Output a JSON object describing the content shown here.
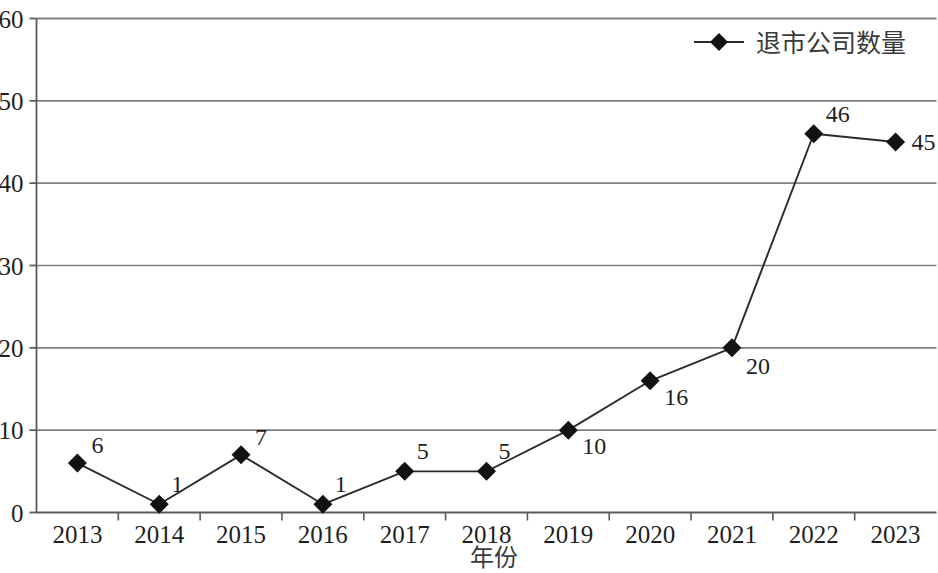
{
  "chart_data": {
    "type": "line",
    "title": "",
    "subtitle": "",
    "xlabel": "年份",
    "ylabel": "",
    "categories": [
      "2013",
      "2014",
      "2015",
      "2016",
      "2017",
      "2018",
      "2019",
      "2020",
      "2021",
      "2022",
      "2023"
    ],
    "values": [
      6,
      1,
      7,
      1,
      5,
      5,
      10,
      16,
      20,
      46,
      45
    ],
    "data_labels": [
      "6",
      "1",
      "7",
      "1",
      "5",
      "5",
      "10",
      "16",
      "20",
      "46",
      "45"
    ],
    "series": [
      {
        "name": "退市公司数量",
        "values": [
          6,
          1,
          7,
          1,
          5,
          5,
          10,
          16,
          20,
          46,
          45
        ],
        "marker": "diamond",
        "color": "#1a1a1a"
      }
    ],
    "ylim": [
      0,
      60
    ],
    "yticks": [
      0,
      10,
      20,
      30,
      40,
      50,
      60
    ],
    "ytick_labels": [
      "0",
      "10",
      "20",
      "30",
      "40",
      "50",
      "60"
    ],
    "grid": "horizontal",
    "legend_position": "top-right",
    "legend": [
      "退市公司数量"
    ],
    "line_color": "#2b2b2b",
    "grid_color": "#808080",
    "axis_color": "#5a5a5a",
    "label_offsets": [
      {
        "dx": 14,
        "dy": -10
      },
      {
        "dx": 12,
        "dy": -12
      },
      {
        "dx": 14,
        "dy": -10
      },
      {
        "dx": 12,
        "dy": -12
      },
      {
        "dx": 12,
        "dy": -12
      },
      {
        "dx": 12,
        "dy": -12
      },
      {
        "dx": 14,
        "dy": 24
      },
      {
        "dx": 14,
        "dy": 24
      },
      {
        "dx": 14,
        "dy": 26
      },
      {
        "dx": 12,
        "dy": -12
      },
      {
        "dx": 16,
        "dy": 8
      }
    ]
  },
  "legend": {
    "label": "退市公司数量",
    "marker_name": "diamond-marker"
  },
  "axes": {
    "x_title": "年份",
    "y_ticks": [
      "0",
      "10",
      "20",
      "30",
      "40",
      "50",
      "60"
    ],
    "x_ticks": [
      "2013",
      "2014",
      "2015",
      "2016",
      "2017",
      "2018",
      "2019",
      "2020",
      "2021",
      "2022",
      "2023"
    ]
  }
}
